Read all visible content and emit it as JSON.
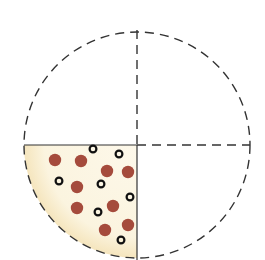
{
  "diagram": {
    "title": "",
    "circle": {
      "cx": 137,
      "cy": 145,
      "r": 113,
      "stroke": "#333333",
      "dash": "9 6"
    },
    "axes": {
      "vertical_x": 137,
      "horizontal_y": 145
    },
    "filled_quadrant": {
      "position": "bottom-left",
      "fill": "#fbf4df",
      "edge_fill": "#f6e8c4"
    },
    "colors": {
      "filled_dot": "#a54b3c",
      "ring_dot": "#111111",
      "line": "#333333"
    },
    "dots": [
      {
        "type": "filled",
        "x": 55,
        "y": 160
      },
      {
        "type": "filled",
        "x": 81,
        "y": 161
      },
      {
        "type": "filled",
        "x": 107,
        "y": 171
      },
      {
        "type": "filled",
        "x": 128,
        "y": 172
      },
      {
        "type": "filled",
        "x": 77,
        "y": 187
      },
      {
        "type": "filled",
        "x": 77,
        "y": 208
      },
      {
        "type": "filled",
        "x": 113,
        "y": 206
      },
      {
        "type": "filled",
        "x": 128,
        "y": 225
      },
      {
        "type": "filled",
        "x": 105,
        "y": 230
      },
      {
        "type": "ring",
        "x": 93,
        "y": 149
      },
      {
        "type": "ring",
        "x": 119,
        "y": 154
      },
      {
        "type": "ring",
        "x": 59,
        "y": 181
      },
      {
        "type": "ring",
        "x": 101,
        "y": 184
      },
      {
        "type": "ring",
        "x": 130,
        "y": 197
      },
      {
        "type": "ring",
        "x": 98,
        "y": 212
      },
      {
        "type": "ring",
        "x": 121,
        "y": 240
      }
    ]
  }
}
